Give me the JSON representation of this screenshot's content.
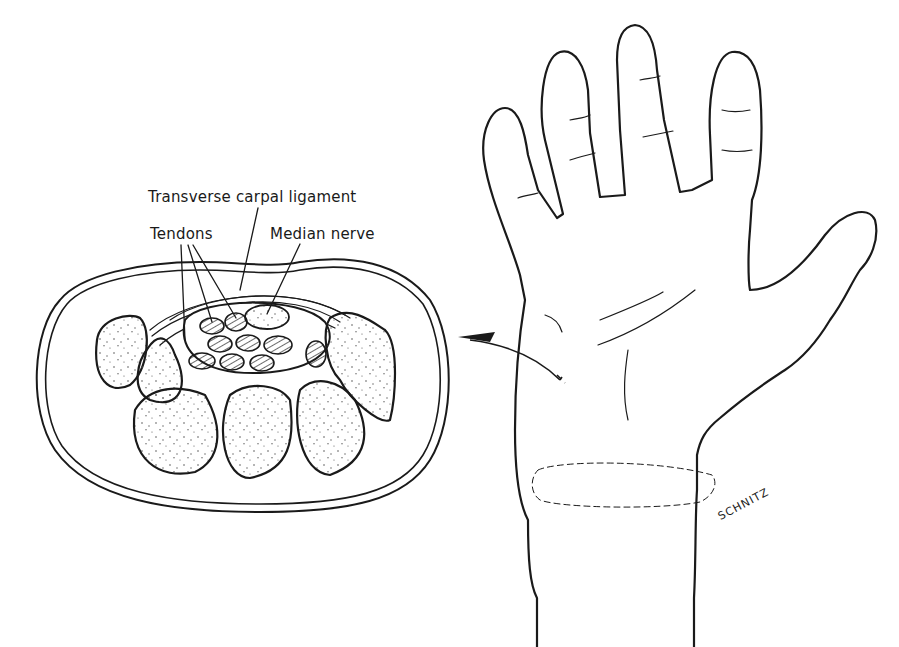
{
  "figure": {
    "labels": {
      "transverse_carpal_ligament": "Transverse carpal ligament",
      "tendons": "Tendons",
      "median_nerve": "Median nerve"
    },
    "signature": "SCHNITZ",
    "colors": {
      "ink": "#1a1a1a",
      "background": "#ffffff",
      "stipple": "#555555"
    }
  }
}
